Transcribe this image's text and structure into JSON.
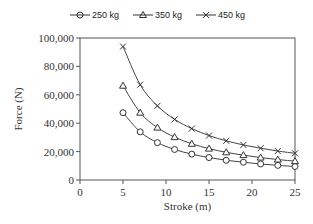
{
  "chart_data": {
    "type": "line",
    "title": "",
    "xlabel": "Stroke (m)",
    "ylabel": "Force (N)",
    "xlim": [
      0,
      25
    ],
    "ylim": [
      0,
      100000
    ],
    "x_ticks": [
      0,
      5,
      10,
      15,
      20,
      25
    ],
    "y_ticks": [
      0,
      20000,
      40000,
      60000,
      80000,
      100000
    ],
    "y_tick_labels": [
      "0",
      "20,000",
      "40,000",
      "60,000",
      "80,000",
      "100,000"
    ],
    "grid": false,
    "legend_position": "top",
    "x": [
      5,
      7,
      9,
      11,
      13,
      15,
      17,
      19,
      21,
      23,
      25
    ],
    "series": [
      {
        "name": "250 kg",
        "marker": "circle",
        "values": [
          47400,
          33900,
          26300,
          21500,
          18200,
          15800,
          13900,
          12500,
          11300,
          10300,
          9500
        ]
      },
      {
        "name": "350 kg",
        "marker": "triangle",
        "values": [
          66400,
          47400,
          36900,
          30200,
          25500,
          22100,
          19500,
          17500,
          15800,
          14400,
          13300
        ]
      },
      {
        "name": "450 kg",
        "marker": "x",
        "values": [
          94000,
          67100,
          52200,
          42700,
          36200,
          31300,
          27600,
          24700,
          22400,
          20400,
          18800
        ]
      }
    ]
  },
  "legend": {
    "items": [
      "250 kg",
      "350 kg",
      "450 kg"
    ]
  }
}
